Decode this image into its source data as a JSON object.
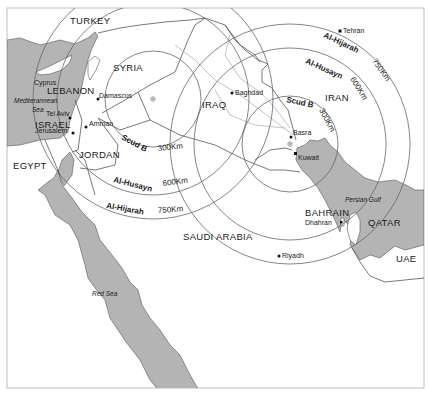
{
  "map": {
    "title": "Iraqi missile ranges",
    "colors": {
      "background": "#ffffff",
      "water": "#b4b4b4",
      "border": "#555555",
      "range_ring": "#666666",
      "frame": "#bdbdbd",
      "text": "#1a1a1a"
    },
    "countries": {
      "turkey": "TURKEY",
      "syria": "SYRIA",
      "lebanon": "LEBANON",
      "israel": "ISRAEL",
      "jordan": "JORDAN",
      "egypt": "EGYPT",
      "iraq": "IRAQ",
      "iran": "IRAN",
      "saudi_arabia": "SAUDI ARABIA",
      "bahrain": "BAHRAIN",
      "qatar": "QATAR",
      "uae": "UAE"
    },
    "cities": {
      "tehran": "Tehran",
      "baghdad": "Baghdad",
      "damascus": "Damascus",
      "amman": "Amman",
      "tel_aviv": "Tel Aviv",
      "jerusalem": "Jerusalem",
      "basra": "Basra",
      "kuwait": "Kuwait",
      "dhahran": "Dhahran",
      "riyadh": "Riyadh"
    },
    "water_bodies": {
      "mediterranean_line1": "Mediterannean",
      "mediterranean_line2": "Sea",
      "cyprus": "Cyprus",
      "red_sea": "Red Sea",
      "persian_gulf": "Persian Gulf"
    },
    "ranges": [
      {
        "name": "Scud B",
        "distance": "300Km"
      },
      {
        "name": "Al-Husayn",
        "distance": "600Km"
      },
      {
        "name": "Al-Hijarah",
        "distance": "750Km"
      }
    ],
    "west_rings": {
      "scud_name": "Scud B",
      "scud_km": "300Km",
      "husayn_name": "Al-Husayn",
      "husayn_km": "600Km",
      "hijarah_name": "Al-Hijarah",
      "hijarah_km": "750Km"
    },
    "east_rings": {
      "scud_name": "Scud B",
      "scud_km": "300Km",
      "husayn_name": "Al-Husayn",
      "husayn_km": "600Km",
      "hijarah_name": "Al-Hijarah",
      "hijarah_km": "750Km"
    },
    "launch_sites": {
      "west": "asterisk-marker",
      "east": "asterisk-marker"
    }
  }
}
